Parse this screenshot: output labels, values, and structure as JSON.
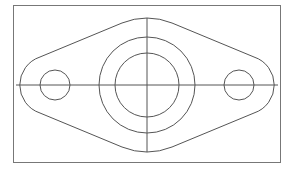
{
  "drawing": {
    "type": "flange-plate-top-view",
    "colors": {
      "line": "#555555",
      "border": "#777777",
      "background": "#ffffff"
    },
    "border": {
      "x": 13.5,
      "y": 5.5,
      "w": 267,
      "h": 157
    },
    "center": {
      "x": 147,
      "y": 85
    },
    "centerlines": {
      "horizontal": {
        "x1": 16,
        "x2": 278,
        "y": 85
      },
      "vertical": {
        "x": 147,
        "y1": 18,
        "y2": 152
      }
    },
    "circles": [
      {
        "name": "bore-outer",
        "cx": 147,
        "cy": 85,
        "r": 48
      },
      {
        "name": "bore-inner",
        "cx": 147,
        "cy": 85,
        "r": 32
      },
      {
        "name": "bolt-hole-left",
        "cx": 55,
        "cy": 85,
        "r": 15
      },
      {
        "name": "bolt-hole-right",
        "cx": 239,
        "cy": 85,
        "r": 15
      }
    ],
    "outline_path": "M 147 18 A 67 67 0 0 1 172 23 L 254 57 A 29.5 29.5 0 0 1 254 113 L 172 147 A 67 67 0 0 1 122 147 L 40 113 A 29.5 29.5 0 0 1 40 57 L 122 23 A 67 67 0 0 1 147 18 Z"
  }
}
